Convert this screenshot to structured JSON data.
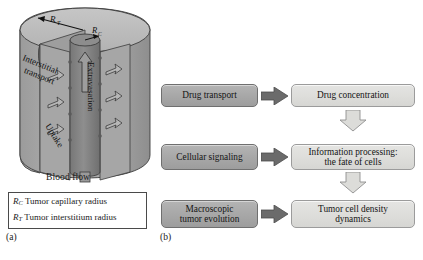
{
  "figure": {
    "panel_a": {
      "tag": "(a)",
      "diagram_name": "tumor-capillary-cylinder",
      "annotations": {
        "r_t_symbol": "R",
        "r_t_subscript": "T",
        "r_c_symbol": "R",
        "r_c_subscript": "C",
        "interstitial_transport": "Interstitial transport",
        "interstitial_transport_line1": "Interstitial",
        "interstitial_transport_line2": "transport",
        "extravasation": "Extravasation",
        "uptake": "Uptake",
        "blood_flow": "Blood flow"
      },
      "legend": {
        "rows": [
          {
            "symbol": "R",
            "subscript": "C",
            "text": "Tumor capillary radius"
          },
          {
            "symbol": "R",
            "subscript": "T",
            "text": "Tumor interstitium radius"
          }
        ]
      },
      "colors": {
        "interstitium_fill": "#a9a9a9",
        "interstitium_top": "#bdbdbd",
        "capillary_fill": "#8a8a8a",
        "outline": "#3c3c3c"
      }
    },
    "panel_b": {
      "tag": "(b)",
      "flow_rows": [
        {
          "left": "Drug transport",
          "right": "Drug concentration"
        },
        {
          "left": "Cellular signaling",
          "right_line1": "Information processing:",
          "right_line2": "the fate of cells"
        },
        {
          "left_line1": "Macroscopic",
          "left_line2": "tumor evolution",
          "right_line1": "Tumor cell density",
          "right_line2": "dynamics"
        }
      ],
      "connectors": {
        "horizontal_arrow": "arrow-right-solid",
        "vertical_arrow": "arrow-down-outline"
      },
      "colors": {
        "left_box": "#a9a9a9",
        "right_box": "#dededb",
        "solid_arrow": "#6b6b6b",
        "outline_arrow": "#d8d8d5"
      }
    }
  }
}
